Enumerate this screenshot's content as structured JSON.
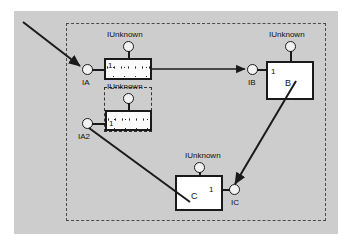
{
  "diagram": {
    "colors": {
      "page_background": "#ffffff",
      "panel_background": "#cdcdcd",
      "stroke": "#1a1a1a",
      "boundary_stroke": "#4a4a4a",
      "node_fill": "#ffffff"
    },
    "boundary": {
      "style": "dashed",
      "label": ""
    },
    "selection": {
      "style": "dashed",
      "label": ""
    },
    "nodes": [
      {
        "id": "a",
        "name": "",
        "num": "1",
        "style": "textured",
        "unknown_label": "IUnknown"
      },
      {
        "id": "a2",
        "name": "",
        "num": "1",
        "style": "textured",
        "unknown_label": "IUnknown"
      },
      {
        "id": "b",
        "name": "B",
        "num": "1",
        "style": "plain",
        "unknown_label": "IUnknown"
      },
      {
        "id": "c",
        "name": "C",
        "num": "1",
        "style": "plain",
        "unknown_label": "IUnknown"
      }
    ],
    "interfaces": [
      {
        "id": "ia",
        "label": "IA"
      },
      {
        "id": "ia2",
        "label": "IA2"
      },
      {
        "id": "ib",
        "label": "IB"
      },
      {
        "id": "ic",
        "label": "IC"
      }
    ],
    "unknown_labels": {
      "a": "IUnknown",
      "a2": "IUnknown",
      "b": "IUnknown",
      "c": "IUnknown"
    }
  }
}
